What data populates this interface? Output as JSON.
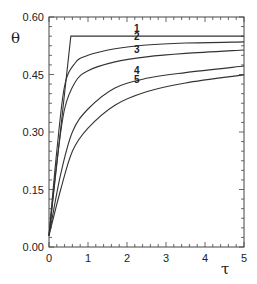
{
  "chart_data": {
    "type": "line",
    "title": "",
    "xlabel": "τ",
    "ylabel": "θ",
    "xlim": [
      0,
      5
    ],
    "ylim": [
      0,
      0.6
    ],
    "grid": false,
    "legend": "none (curves labeled inline 1–5)",
    "x_ticks": [
      "0",
      "1",
      "2",
      "3",
      "4",
      "5"
    ],
    "y_ticks": [
      "0.00",
      "0.15",
      "0.30",
      "0.45",
      "0.60"
    ],
    "series": [
      {
        "name": "1",
        "x": [
          0,
          0.56,
          5
        ],
        "y": [
          0.03,
          0.55,
          0.55
        ]
      },
      {
        "name": "2",
        "x": [
          0,
          0.2,
          0.4,
          0.67,
          1.0,
          1.69,
          2.5,
          3.5,
          5
        ],
        "y": [
          0.03,
          0.25,
          0.42,
          0.48,
          0.5,
          0.517,
          0.527,
          0.532,
          0.535
        ]
      },
      {
        "name": "3",
        "x": [
          0,
          0.2,
          0.4,
          0.67,
          1.0,
          1.69,
          2.5,
          3.5,
          5
        ],
        "y": [
          0.03,
          0.22,
          0.36,
          0.43,
          0.46,
          0.483,
          0.496,
          0.505,
          0.514
        ]
      },
      {
        "name": "4",
        "x": [
          0,
          0.3,
          0.6,
          1.0,
          1.69,
          2.5,
          3.5,
          5
        ],
        "y": [
          0.03,
          0.19,
          0.3,
          0.36,
          0.415,
          0.44,
          0.455,
          0.472
        ]
      },
      {
        "name": "5",
        "x": [
          0,
          0.3,
          0.6,
          1.0,
          1.69,
          2.5,
          3.5,
          5
        ],
        "y": [
          0.03,
          0.15,
          0.25,
          0.31,
          0.37,
          0.405,
          0.428,
          0.449
        ]
      }
    ],
    "labels": [
      {
        "text": "1",
        "x": 2.25,
        "y": 0.555
      },
      {
        "text": "2",
        "x": 2.25,
        "y": 0.535
      },
      {
        "text": "3",
        "x": 2.25,
        "y": 0.502
      },
      {
        "text": "4",
        "x": 2.25,
        "y": 0.446
      },
      {
        "text": "5",
        "x": 2.25,
        "y": 0.423
      }
    ]
  }
}
